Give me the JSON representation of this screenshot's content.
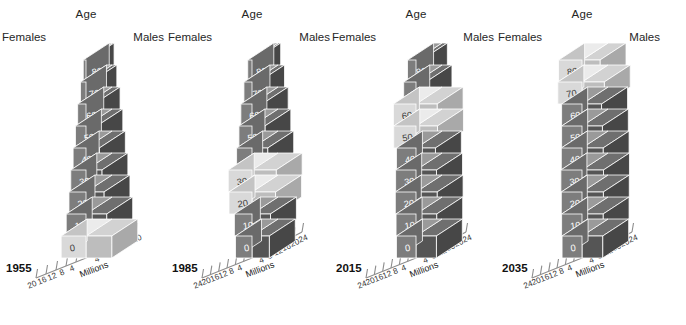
{
  "figure": {
    "age_label": "Age",
    "females_label": "Females",
    "males_label": "Males",
    "axis_title": "Millions",
    "colors": {
      "female_front": "#7d7d7d",
      "female_top": "#9a9a9a",
      "female_side": "#6a6a6a",
      "male_front": "#555555",
      "male_top": "#6f6f6f",
      "male_side": "#474747",
      "highlight_female_front": "#d9d9d9",
      "highlight_female_top": "#ebebeb",
      "highlight_female_side": "#c4c4c4",
      "highlight_male_front": "#bdbdbd",
      "highlight_male_top": "#d2d2d2",
      "highlight_male_side": "#a9a9a9",
      "axis": "#8c8c8c",
      "text": "#262626"
    }
  },
  "chart_data": [
    {
      "type": "bar",
      "title": "1955",
      "xlabel": "Millions",
      "ylabel": "Age",
      "orientation": "population-pyramid-3d",
      "categories": [
        "0",
        "10",
        "20",
        "30",
        "40",
        "50",
        "60",
        "70",
        "80+"
      ],
      "xticks_left": [
        20,
        16,
        12,
        8,
        4
      ],
      "xticks_right": [
        4,
        8,
        12,
        16,
        20
      ],
      "xlim": [
        20,
        20
      ],
      "grid": false,
      "legend": [
        "Females",
        "Males"
      ],
      "highlight_categories": [
        "0"
      ],
      "series": [
        {
          "name": "Females",
          "values": [
            10.8,
            8.6,
            7.4,
            6.6,
            5.6,
            4.6,
            3.6,
            2.4,
            1.2
          ]
        },
        {
          "name": "Males",
          "values": [
            11.2,
            9.0,
            7.8,
            6.9,
            5.8,
            4.7,
            3.5,
            2.1,
            0.9
          ]
        }
      ]
    },
    {
      "type": "bar",
      "title": "1985",
      "xlabel": "Millions",
      "ylabel": "Age",
      "orientation": "population-pyramid-3d",
      "categories": [
        "0",
        "10",
        "20",
        "30",
        "40",
        "50",
        "60",
        "70",
        "80+"
      ],
      "xticks_left": [
        24,
        20,
        16,
        12,
        8,
        4
      ],
      "xticks_right": [
        4,
        8,
        12,
        16,
        20,
        24
      ],
      "xlim": [
        24,
        24
      ],
      "grid": false,
      "legend": [
        "Females",
        "Males"
      ],
      "highlight_categories": [
        "20",
        "30"
      ],
      "series": [
        {
          "name": "Females",
          "values": [
            8.6,
            9.2,
            12.0,
            12.4,
            8.0,
            6.8,
            5.8,
            4.2,
            2.2
          ]
        },
        {
          "name": "Males",
          "values": [
            9.0,
            9.6,
            12.3,
            12.6,
            8.2,
            6.7,
            5.3,
            3.4,
            1.4
          ]
        }
      ]
    },
    {
      "type": "bar",
      "title": "2015",
      "xlabel": "Millions",
      "ylabel": "Age",
      "orientation": "population-pyramid-3d",
      "categories": [
        "0",
        "10",
        "20",
        "30",
        "40",
        "50",
        "60",
        "70",
        "80+"
      ],
      "xticks_left": [
        24,
        20,
        16,
        12,
        8,
        4
      ],
      "xticks_right": [
        4,
        8,
        12,
        16,
        20,
        24
      ],
      "xlim": [
        24,
        24
      ],
      "grid": false,
      "legend": [
        "Females",
        "Males"
      ],
      "highlight_categories": [
        "50",
        "60"
      ],
      "series": [
        {
          "name": "Females",
          "values": [
            10.2,
            10.4,
            10.8,
            10.6,
            10.2,
            11.6,
            11.8,
            6.4,
            4.4
          ]
        },
        {
          "name": "Males",
          "values": [
            10.6,
            10.8,
            11.0,
            10.7,
            10.1,
            11.2,
            11.0,
            5.2,
            2.8
          ]
        }
      ]
    },
    {
      "type": "bar",
      "title": "2035",
      "xlabel": "Millions",
      "ylabel": "Age",
      "orientation": "population-pyramid-3d",
      "categories": [
        "0",
        "10",
        "20",
        "30",
        "40",
        "50",
        "60",
        "70",
        "80+"
      ],
      "xticks_left": [
        24,
        20,
        16,
        12,
        8,
        4
      ],
      "xticks_right": [
        4,
        8,
        12,
        16,
        20,
        24
      ],
      "xlim": [
        24,
        24
      ],
      "grid": false,
      "legend": [
        "Females",
        "Males"
      ],
      "highlight_categories": [
        "70",
        "80+"
      ],
      "series": [
        {
          "name": "Females",
          "values": [
            10.4,
            10.6,
            10.8,
            11.0,
            10.8,
            10.6,
            10.6,
            12.6,
            12.2
          ]
        },
        {
          "name": "Males",
          "values": [
            10.8,
            11.0,
            11.1,
            11.2,
            11.0,
            10.6,
            10.2,
            11.6,
            9.4
          ]
        }
      ]
    }
  ]
}
